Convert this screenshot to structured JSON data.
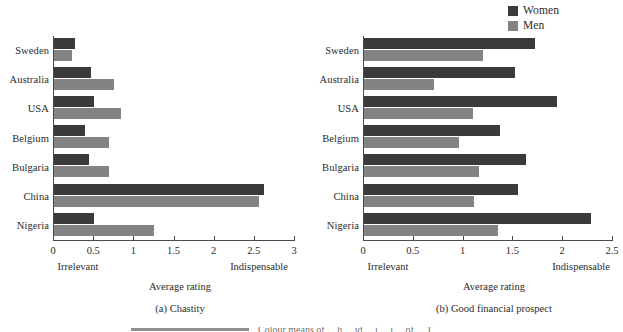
{
  "legend": {
    "items": [
      {
        "label": "Women",
        "color": "#3a3a3a",
        "icon": "square-swatch-icon"
      },
      {
        "label": "Men",
        "color": "#838383",
        "icon": "square-swatch-icon"
      }
    ]
  },
  "panels": [
    {
      "id": "a",
      "caption": "(a) Chastity",
      "axis_title": "Average rating",
      "anchor_low": "Irrelevant",
      "anchor_high": "Indispensable",
      "tick_labels": [
        "0",
        "0.5",
        "1",
        "1.5",
        "2",
        "2.5",
        "3"
      ]
    },
    {
      "id": "b",
      "caption": "(b) Good financial prospect",
      "axis_title": "Average rating",
      "anchor_low": "Irrelevant",
      "anchor_high": "Indispensable",
      "tick_labels": [
        "0",
        "0.5",
        "1",
        "1.5",
        "2",
        "2.5"
      ]
    }
  ],
  "bottom_caption": {
    "rule": "",
    "text": "Colour means of ... h ... id ... i ... i ... of ... T"
  },
  "chart_data": [
    {
      "type": "bar",
      "orientation": "horizontal",
      "title": "(a) Chastity",
      "xlabel": "Average rating",
      "ylabel": "",
      "xlim": [
        0,
        3
      ],
      "xticks": [
        0,
        0.5,
        1,
        1.5,
        2,
        2.5,
        3
      ],
      "grid": false,
      "legend_position": "top-right",
      "anchors": {
        "low": "Irrelevant",
        "high": "Indispensable"
      },
      "categories": [
        "Sweden",
        "Australia",
        "USA",
        "Belgium",
        "Bulgaria",
        "China",
        "Nigeria"
      ],
      "series": [
        {
          "name": "Women",
          "color": "#3a3a3a",
          "values": [
            0.26,
            0.46,
            0.5,
            0.38,
            0.44,
            2.62,
            0.5
          ]
        },
        {
          "name": "Men",
          "color": "#838383",
          "values": [
            0.22,
            0.75,
            0.84,
            0.68,
            0.68,
            2.55,
            1.25
          ]
        }
      ]
    },
    {
      "type": "bar",
      "orientation": "horizontal",
      "title": "(b) Good financial prospect",
      "xlabel": "Average rating",
      "ylabel": "",
      "xlim": [
        0,
        2.5
      ],
      "xticks": [
        0,
        0.5,
        1,
        1.5,
        2,
        2.5
      ],
      "grid": false,
      "legend_position": "top-right",
      "anchors": {
        "low": "Irrelevant",
        "high": "Indispensable"
      },
      "categories": [
        "Sweden",
        "Australia",
        "USA",
        "Belgium",
        "Bulgaria",
        "China",
        "Nigeria"
      ],
      "series": [
        {
          "name": "Women",
          "color": "#3a3a3a",
          "values": [
            1.72,
            1.52,
            1.94,
            1.37,
            1.63,
            1.55,
            2.28
          ]
        },
        {
          "name": "Men",
          "color": "#838383",
          "values": [
            1.19,
            0.7,
            1.09,
            0.95,
            1.15,
            1.1,
            1.35
          ]
        }
      ]
    }
  ]
}
